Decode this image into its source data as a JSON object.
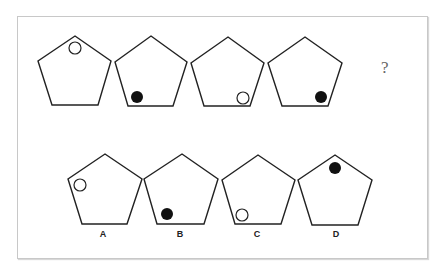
{
  "puzzle": {
    "question_mark": "?",
    "sequence": [
      {
        "index": 1,
        "dot": "hollow",
        "position": "top"
      },
      {
        "index": 2,
        "dot": "filled",
        "position": "bottom-left"
      },
      {
        "index": 3,
        "dot": "hollow",
        "position": "bottom-right"
      },
      {
        "index": 4,
        "dot": "filled",
        "position": "right"
      }
    ],
    "options": [
      {
        "label": "A",
        "dot": "hollow",
        "position": "left"
      },
      {
        "label": "B",
        "dot": "filled",
        "position": "bottom-left"
      },
      {
        "label": "C",
        "dot": "hollow",
        "position": "bottom-left"
      },
      {
        "label": "D",
        "dot": "filled",
        "position": "top"
      }
    ],
    "colors": {
      "stroke": "#222222",
      "filled_dot": "#111111",
      "frame": "#c8c8c8"
    }
  }
}
